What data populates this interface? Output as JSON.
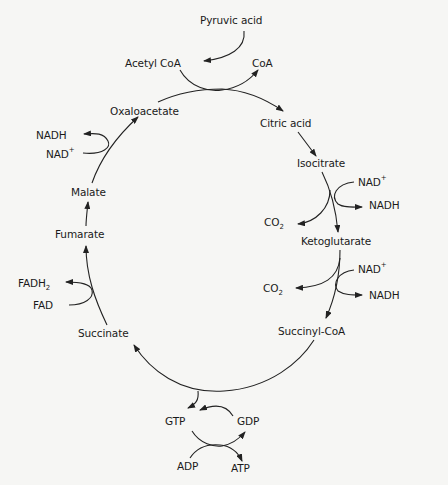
{
  "diagram": {
    "colors": {
      "background": "#f6f6f4",
      "ink": "#222222"
    },
    "entry": {
      "substrate": "Pyruvic acid",
      "product": "Acetyl CoA",
      "released": "CoA"
    },
    "intermediates": [
      "Citric acid",
      "Isocitrate",
      "Ketoglutarate",
      "Succinyl-CoA",
      "Succinate",
      "Fumarate",
      "Malate",
      "Oxaloacetate"
    ],
    "cofactors": {
      "isocitrate_step": {
        "in": "NAD",
        "in_sup": "+",
        "out": "NADH",
        "co2": "CO",
        "co2_sub": "2"
      },
      "ketoglutarate_step": {
        "in": "NAD",
        "in_sup": "+",
        "out": "NADH",
        "co2": "CO",
        "co2_sub": "2"
      },
      "succinyl_step": {
        "gtp": "GTP",
        "gdp": "GDP",
        "adp": "ADP",
        "atp": "ATP"
      },
      "succinate_step": {
        "in": "FAD",
        "out": "FADH",
        "out_sub": "2"
      },
      "malate_step": {
        "in": "NAD",
        "in_sup": "+",
        "out": "NADH"
      }
    }
  }
}
